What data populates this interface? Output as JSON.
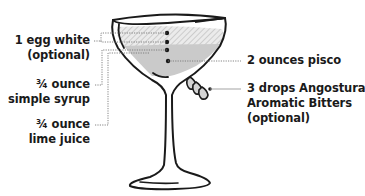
{
  "diagram": {
    "colors": {
      "outline": "#1a1a1a",
      "liquid": "#c9c9c9",
      "foam_hatch": "#d9d9d9",
      "leader": "#777777",
      "text": "#1a1a1a"
    },
    "labels_left": [
      {
        "id": "egg-white",
        "line1": "1 egg white",
        "line2": "(optional)"
      },
      {
        "id": "simple-syrup",
        "line1": "¾ ounce",
        "line2": "simple syrup"
      },
      {
        "id": "lime-juice",
        "line1": "¾ ounce",
        "line2": "lime juice"
      }
    ],
    "labels_right": [
      {
        "id": "pisco",
        "line1": "2 ounces pisco"
      },
      {
        "id": "bitters",
        "line1": "3 drops Angostura",
        "line2": "Aromatic Bitters",
        "line3": "(optional)"
      }
    ],
    "icons": {
      "glass": "coupe-glass-icon",
      "drops": "bitters-drops-icon"
    }
  }
}
